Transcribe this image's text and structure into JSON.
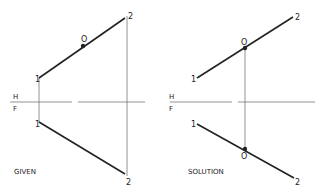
{
  "given": {
    "caption": "GIVEN",
    "fold_top": "H",
    "fold_bottom": "F",
    "top_p1": "1",
    "top_p2": "2",
    "top_o": "O",
    "bot_p1": "1",
    "bot_p2": "2"
  },
  "solution": {
    "caption": "SOLUTION",
    "fold_top": "H",
    "fold_bottom": "F",
    "top_p1": "1",
    "top_p2": "2",
    "top_o": "O",
    "bot_p1": "1",
    "bot_p2": "2",
    "bot_o": "O"
  }
}
